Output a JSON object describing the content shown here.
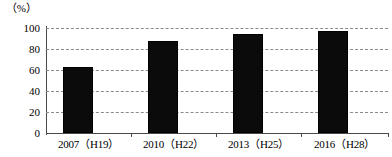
{
  "chart_data": {
    "type": "bar",
    "title": "",
    "subtitle": "",
    "xlabel": "",
    "ylabel": "(%)",
    "unit_label": "（%）",
    "categories": [
      "2007（H19）",
      "2010（H22）",
      "2013（H25）",
      "2016（H28）"
    ],
    "values": [
      63,
      88,
      94,
      97
    ],
    "ylim": [
      0,
      100
    ],
    "y_ticks": [
      0,
      20,
      40,
      60,
      80,
      100
    ],
    "y_tick_labels": [
      "0",
      "20",
      "40",
      "60",
      "80",
      "100"
    ],
    "grid": true,
    "grid_style": "dashed-horizontal",
    "legend": null,
    "legend_position": "none",
    "series": [
      {
        "name": "",
        "values": [
          63,
          88,
          94,
          97
        ],
        "color": "#0b0b0b"
      }
    ],
    "colors": {
      "bar": "#0b0b0b",
      "axis": "#4a4a4a",
      "grid": "#8a8a8a",
      "background": "#ffffff",
      "text": "#000000"
    }
  }
}
